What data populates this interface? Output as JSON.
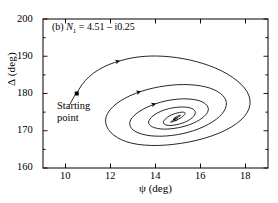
{
  "figure": {
    "panel_label": "(b)",
    "annotation_symbol": "N",
    "annotation_subscript": "1",
    "annotation_equals": "= 4.51 – i0.25",
    "annotation_full": "(b) N1 = 4.51 – i0.25",
    "start_label_line1": "Starting",
    "start_label_line2": "point"
  },
  "chart_data": {
    "type": "line",
    "title": "(b) N1 = 4.51 – i0.25",
    "xlabel": "ψ (deg)",
    "ylabel": "Δ (deg)",
    "xlim": [
      9,
      19
    ],
    "ylim": [
      160,
      200
    ],
    "xticks": [
      10,
      12,
      14,
      16,
      18
    ],
    "yticks": [
      160,
      170,
      180,
      190,
      200
    ],
    "xtick_labels": [
      "10",
      "12",
      "14",
      "16",
      "18"
    ],
    "ytick_labels": [
      "160",
      "170",
      "180",
      "190",
      "200"
    ],
    "minor_ticks_per_interval": 1,
    "grid": false,
    "legend": "none",
    "line_color": "#000000",
    "line_width": 0.8,
    "markers": [
      {
        "name": "starting-point",
        "x": 10.5,
        "y": 180.0,
        "shape": "square",
        "filled": true
      },
      {
        "name": "direction-arrow-1",
        "x": 12.35,
        "y": 189.0,
        "shape": "arrowhead"
      },
      {
        "name": "direction-arrow-2",
        "x": 13.45,
        "y": 180.0,
        "shape": "arrowhead"
      },
      {
        "name": "direction-arrow-3",
        "x": 14.1,
        "y": 176.2,
        "shape": "arrowhead"
      }
    ],
    "fixed_point": {
      "x": 14.8,
      "y": 173.0
    },
    "annotations": [
      {
        "text": "Starting point",
        "x": 10.9,
        "y": 177.0
      },
      {
        "text": "(b) N1 = 4.51 – i0.25",
        "x": 9.45,
        "y": 197.5
      }
    ],
    "series": [
      {
        "name": "trajectory",
        "description": "inward spiral from starting point to fixed point",
        "x": [
          10.5,
          10.72,
          11.05,
          11.45,
          11.92,
          12.42,
          12.95,
          13.5,
          14.05,
          14.62,
          15.22,
          15.82,
          16.4,
          16.95,
          17.42,
          17.82,
          18.1,
          18.22,
          18.18,
          17.98,
          17.62,
          17.12,
          16.52,
          15.85,
          15.15,
          14.45,
          13.8,
          13.2,
          12.7,
          12.3,
          12.0,
          11.82,
          11.76,
          11.86,
          12.08,
          12.42,
          12.85,
          13.35,
          13.9,
          14.45,
          15.0,
          15.52,
          16.0,
          16.42,
          16.76,
          17.0,
          17.14,
          17.16,
          17.06,
          16.86,
          16.55,
          16.16,
          15.7,
          15.22,
          14.72,
          14.24,
          13.8,
          13.42,
          13.12,
          12.92,
          12.84,
          12.88,
          13.04,
          13.3,
          13.64,
          14.02,
          14.42,
          14.82,
          15.22,
          15.58,
          15.9,
          16.14,
          16.3,
          16.36,
          16.32,
          16.18,
          15.96,
          15.68,
          15.36,
          15.02,
          14.68,
          14.36,
          14.08,
          13.86,
          13.72,
          13.68,
          13.74,
          13.88,
          14.08,
          14.34,
          14.62,
          14.92,
          15.2,
          15.44,
          15.62,
          15.74,
          15.78,
          15.74,
          15.64,
          15.48,
          15.28,
          15.06,
          14.84,
          14.64,
          14.48,
          14.38,
          14.34,
          14.38,
          14.48,
          14.62,
          14.8,
          14.98,
          15.14,
          15.26,
          15.32,
          15.32,
          15.26,
          15.16,
          15.02,
          14.88,
          14.76,
          14.68,
          14.66,
          14.7,
          14.78,
          14.88,
          15.0,
          15.08,
          15.12,
          15.1,
          15.04,
          14.96,
          14.88,
          14.82,
          14.8,
          14.82,
          14.88,
          14.94,
          14.98,
          14.98,
          14.94,
          14.9,
          14.86,
          14.84,
          14.86,
          14.88,
          14.9,
          14.88,
          14.86,
          14.84,
          14.84,
          14.86,
          14.86,
          14.85,
          14.84,
          14.84,
          14.85,
          14.85,
          14.8
        ],
        "y": [
          180.0,
          182.4,
          184.6,
          186.4,
          187.8,
          188.8,
          189.6,
          190.0,
          190.1,
          189.9,
          189.4,
          188.6,
          187.5,
          186.1,
          184.4,
          182.5,
          180.4,
          178.2,
          176.0,
          173.9,
          171.9,
          170.1,
          168.6,
          167.4,
          166.6,
          166.1,
          166.0,
          166.3,
          167.0,
          168.1,
          169.5,
          171.1,
          172.9,
          174.7,
          176.4,
          178.0,
          179.4,
          180.6,
          181.5,
          182.1,
          182.4,
          182.4,
          182.1,
          181.5,
          180.6,
          179.5,
          178.2,
          176.8,
          175.3,
          173.8,
          172.4,
          171.1,
          170.0,
          169.2,
          168.7,
          168.5,
          168.6,
          169.0,
          169.7,
          170.6,
          171.7,
          172.9,
          174.1,
          175.3,
          176.4,
          177.3,
          178.0,
          178.4,
          178.6,
          178.5,
          178.2,
          177.6,
          176.8,
          175.9,
          174.9,
          173.9,
          172.9,
          172.0,
          171.3,
          170.8,
          170.5,
          170.4,
          170.6,
          171.0,
          171.6,
          172.3,
          173.1,
          174.0,
          174.8,
          175.5,
          176.0,
          176.3,
          176.4,
          176.3,
          176.0,
          175.5,
          174.9,
          174.2,
          173.5,
          172.8,
          172.2,
          171.8,
          171.5,
          171.4,
          171.5,
          171.8,
          172.3,
          172.8,
          173.4,
          174.0,
          174.5,
          174.8,
          175.0,
          175.0,
          174.8,
          174.5,
          174.1,
          173.6,
          173.1,
          172.7,
          172.4,
          172.3,
          172.3,
          172.5,
          172.8,
          173.2,
          173.6,
          173.9,
          174.1,
          174.2,
          174.1,
          173.9,
          173.6,
          173.3,
          173.0,
          172.8,
          172.7,
          172.8,
          173.0,
          173.2,
          173.4,
          173.5,
          173.5,
          173.4,
          173.3,
          173.1,
          173.0,
          172.9,
          172.95,
          173.05,
          173.15,
          173.2,
          173.18,
          173.1,
          173.02,
          172.98,
          172.98,
          173.0,
          173.0
        ]
      }
    ]
  }
}
